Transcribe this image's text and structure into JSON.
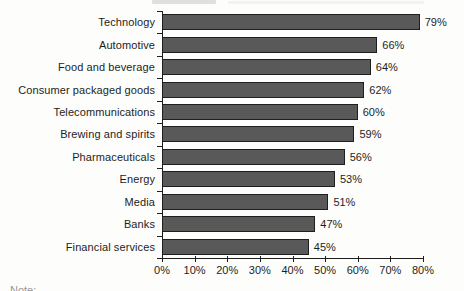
{
  "chart_data": {
    "type": "bar",
    "orientation": "horizontal",
    "title": "",
    "categories": [
      "Technology",
      "Automotive",
      "Food and beverage",
      "Consumer packaged goods",
      "Telecommunications",
      "Brewing and spirits",
      "Pharmaceuticals",
      "Energy",
      "Media",
      "Banks",
      "Financial services"
    ],
    "values": [
      79,
      66,
      64,
      62,
      60,
      59,
      56,
      53,
      51,
      47,
      45
    ],
    "value_labels": [
      "79%",
      "66%",
      "64%",
      "62%",
      "60%",
      "59%",
      "56%",
      "53%",
      "51%",
      "47%",
      "45%"
    ],
    "x_tick_labels": [
      "0%",
      "10%",
      "20%",
      "30%",
      "40%",
      "50%",
      "60%",
      "70%",
      "80%"
    ],
    "x_tick_values": [
      0,
      10,
      20,
      30,
      40,
      50,
      60,
      70,
      80
    ],
    "xlim": [
      0,
      80
    ],
    "xlabel": "",
    "ylabel": "",
    "grid": false,
    "legend": false,
    "bar_color": "#595959",
    "bar_border_color": "#1e1e1e",
    "axis_color": "#1e1e1e",
    "text_color": "#1d1d1d"
  },
  "footnote_fragment": "Note:"
}
